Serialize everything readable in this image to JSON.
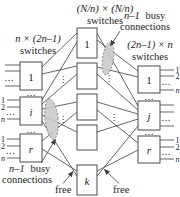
{
  "figure_type": "clos-network-switching-diagram",
  "colors": {
    "background": "#ffffff",
    "line": "#3f3f3f",
    "text": "#1c1c1c",
    "box_fill": "#ffffff",
    "box_stroke": "#4a4a4a",
    "ellipse_fill": "#c9c9c9",
    "ellipse_stroke": "#6e6e6e"
  },
  "glyphs": {
    "hdots": "…",
    "vdots": "⋮"
  },
  "headers": {
    "middle_line1": "(N/n) × (N/n)",
    "middle_line2": "switches",
    "left_line1": "n × (2n–1)",
    "left_line2": "switches",
    "right_line1": "(2n–1) × n",
    "right_line2": "switches"
  },
  "annotations": {
    "busy_top": {
      "var_part": "n–1",
      "word_part": "busy",
      "line2": "connections"
    },
    "busy_bottom": {
      "var_part": "n–1",
      "word_part": "busy",
      "line2": "connections"
    },
    "free_left": "free",
    "free_right": "free"
  },
  "left_column": {
    "boxes": [
      {
        "label": "1",
        "port_labels": []
      },
      {
        "label": "i",
        "port_labels": [
          "1",
          "2",
          "n"
        ]
      },
      {
        "label": "r",
        "port_labels": [
          "1",
          "2",
          "n"
        ]
      }
    ]
  },
  "middle_column": {
    "boxes": [
      {
        "label": "1"
      },
      {
        "label": ""
      },
      {
        "label": ""
      },
      {
        "label": ""
      },
      {
        "label": "k"
      }
    ]
  },
  "right_column": {
    "boxes": [
      {
        "label": "1",
        "port_labels": [
          "1",
          "2",
          "n"
        ]
      },
      {
        "label": "j",
        "port_labels": []
      },
      {
        "label": "r",
        "port_labels": [
          "1",
          "2",
          "n"
        ]
      }
    ]
  }
}
